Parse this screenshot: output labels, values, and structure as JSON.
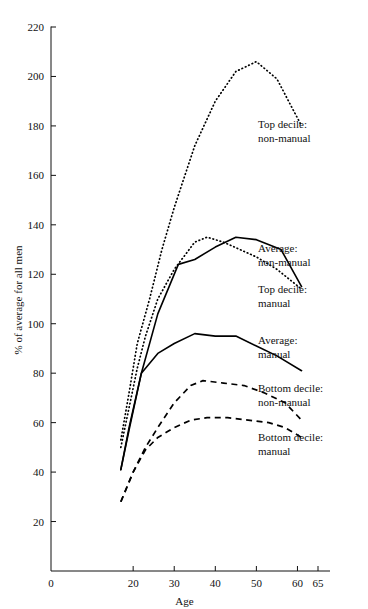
{
  "chart_data": {
    "type": "line",
    "title": "",
    "xlabel": "Age",
    "ylabel": "% of average for all men",
    "xlim": [
      0,
      65
    ],
    "ylim": [
      0,
      220
    ],
    "grid": false,
    "legend_position": "right-inline-annotations",
    "x_ticks": [
      0,
      20,
      30,
      40,
      50,
      60,
      65
    ],
    "x_tick_labels": [
      "0",
      "20",
      "30",
      "40",
      "50",
      "60",
      "65"
    ],
    "y_ticks": [
      20,
      40,
      60,
      80,
      100,
      120,
      140,
      160,
      180,
      200,
      220
    ],
    "y_tick_labels": [
      "20",
      "40",
      "60",
      "80",
      "100",
      "120",
      "140",
      "160",
      "180",
      "200",
      "220"
    ],
    "series": [
      {
        "name": "Top decile: non-manual",
        "style": "dotted",
        "label_lines": [
          "Top decile:",
          "non-manual"
        ],
        "x": [
          17,
          19,
          21,
          24,
          27,
          30,
          35,
          40,
          45,
          50,
          55,
          61
        ],
        "values": [
          53,
          72,
          92,
          110,
          130,
          147,
          172,
          190,
          202,
          206,
          199,
          180
        ]
      },
      {
        "name": "Average: non-manual",
        "style": "dotted",
        "label_lines": [
          "Average:",
          "non-manual"
        ],
        "x": [
          17,
          19,
          21,
          23,
          26,
          30,
          35,
          38,
          42,
          46,
          50,
          55,
          61
        ],
        "values": [
          50,
          66,
          82,
          95,
          110,
          122,
          133,
          135,
          133,
          130,
          127,
          122,
          114
        ]
      },
      {
        "name": "Top decile: manual",
        "style": "solid",
        "label_lines": [
          "Top decile:",
          "manual"
        ],
        "x": [
          17,
          19,
          22,
          26,
          31,
          35,
          40,
          45,
          50,
          56,
          61
        ],
        "values": [
          41,
          58,
          80,
          104,
          124,
          126,
          131,
          135,
          134,
          130,
          115
        ]
      },
      {
        "name": "Average: manual",
        "style": "solid",
        "label_lines": [
          "Average:",
          "manual"
        ],
        "x": [
          17,
          19,
          22,
          26,
          30,
          35,
          40,
          45,
          50,
          55,
          61
        ],
        "values": [
          41,
          57,
          80,
          88,
          92,
          96,
          95,
          95,
          91,
          87,
          81
        ]
      },
      {
        "name": "Bottom decile: non-manual",
        "style": "dashed",
        "label_lines": [
          "Bottom decile:",
          "non-manual"
        ],
        "x": [
          17,
          20,
          23,
          26,
          30,
          34,
          37,
          42,
          47,
          52,
          57,
          61
        ],
        "values": [
          28,
          40,
          50,
          58,
          68,
          75,
          77,
          76,
          75,
          72,
          68,
          61
        ]
      },
      {
        "name": "Bottom decile: manual",
        "style": "dashed",
        "label_lines": [
          "Bottom decile:",
          "manual"
        ],
        "x": [
          17,
          20,
          23,
          26,
          30,
          34,
          38,
          43,
          48,
          53,
          57,
          61
        ],
        "values": [
          28,
          40,
          49,
          54,
          58,
          61,
          62,
          62,
          61,
          60,
          58,
          54
        ]
      }
    ],
    "annotations": [
      {
        "id": "ann-top-decile-non-manual",
        "lines": [
          "Top decile:",
          "non-manual"
        ],
        "x": 258,
        "y": 128
      },
      {
        "id": "ann-average-non-manual",
        "lines": [
          "Average:",
          "non-manual"
        ],
        "x": 258,
        "y": 252
      },
      {
        "id": "ann-top-decile-manual",
        "lines": [
          "Top decile:",
          "manual"
        ],
        "x": 258,
        "y": 293
      },
      {
        "id": "ann-average-manual",
        "lines": [
          "Average:",
          "manual"
        ],
        "x": 258,
        "y": 344
      },
      {
        "id": "ann-bottom-decile-non-manual",
        "lines": [
          "Bottom decile:",
          "non-manual"
        ],
        "x": 258,
        "y": 392
      },
      {
        "id": "ann-bottom-decile-manual",
        "lines": [
          "Bottom decile:",
          "manual"
        ],
        "x": 258,
        "y": 441
      }
    ],
    "colors": {
      "ink": "#111111",
      "background": "#ffffff"
    }
  }
}
